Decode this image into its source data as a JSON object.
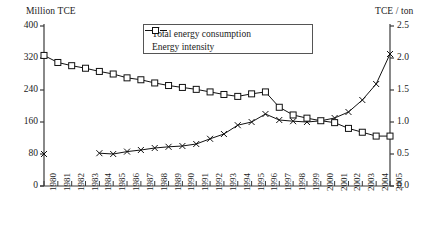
{
  "chart_data": {
    "type": "line",
    "title": "",
    "xlabel": "",
    "ylabel": "Million TCE",
    "y2label": "TCE / ton",
    "ylim": [
      0,
      400
    ],
    "yticks": [
      "0",
      "80",
      "160",
      "240",
      "320",
      "400"
    ],
    "y2lim": [
      0.0,
      2.5
    ],
    "y2ticks": [
      "0.0",
      "0.5",
      "1.0",
      "1.5",
      "2.0",
      "2.5"
    ],
    "grid": false,
    "legend_position": "top-center",
    "legend": [
      "Total energy consumption",
      "Energy intensity"
    ],
    "x": [
      "1980",
      "1981",
      "1982",
      "1983",
      "1984",
      "1985",
      "1986",
      "1987",
      "1988",
      "1989",
      "1990",
      "1991",
      "1992",
      "1993",
      "1994",
      "1995",
      "1996",
      "1997",
      "1998",
      "1999",
      "2000",
      "2001",
      "2002",
      "2003",
      "2004",
      "2005"
    ],
    "series": [
      {
        "name": "Total energy consumption",
        "axis": "left",
        "unit": "Million TCE",
        "marker": "x",
        "gap_after_first_point": true,
        "values": [
          80,
          null,
          null,
          null,
          82,
          80,
          86,
          90,
          95,
          98,
          100,
          105,
          118,
          130,
          152,
          160,
          180,
          165,
          162,
          160,
          163,
          170,
          185,
          215,
          255,
          330
        ]
      },
      {
        "name": "Energy intensity",
        "axis": "right",
        "unit": "TCE / ton",
        "marker": "square",
        "values": [
          2.04,
          1.93,
          1.88,
          1.84,
          1.79,
          1.75,
          1.69,
          1.66,
          1.61,
          1.57,
          1.54,
          1.51,
          1.47,
          1.43,
          1.4,
          1.44,
          1.47,
          1.23,
          1.11,
          1.06,
          1.02,
          0.99,
          0.9,
          0.84,
          0.78,
          0.78
        ]
      }
    ]
  }
}
